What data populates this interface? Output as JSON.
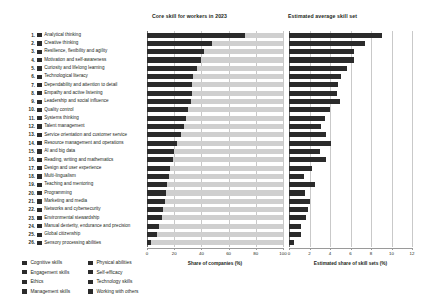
{
  "panels": {
    "left": {
      "title": "Core skill for workers in 2023",
      "axis_title": "Share of companies (%)",
      "ticks": [
        "0",
        "20",
        "40",
        "60",
        "80",
        "100"
      ]
    },
    "right": {
      "title": "Estimated average skill set",
      "axis_title": "Estimated share of skill sets (%)",
      "ticks": [
        "0",
        "2",
        "4",
        "6",
        "8",
        "10",
        "12"
      ]
    }
  },
  "legend": {
    "column1": [
      {
        "label": "Cognitive skills",
        "color": "#2b2b2b"
      },
      {
        "label": "Engagement skills",
        "color": "#2b2b2b"
      },
      {
        "label": "Ethics",
        "color": "#2b2b2b"
      },
      {
        "label": "Management skills",
        "color": "#2b2b2b"
      }
    ],
    "column2": [
      {
        "label": "Physical abilities",
        "color": "#2b2b2b"
      },
      {
        "label": "Self-efficacy",
        "color": "#2b2b2b"
      },
      {
        "label": "Technology skills",
        "color": "#2b2b2b"
      },
      {
        "label": "Working with others",
        "color": "#2b2b2b"
      }
    ]
  },
  "chart_data": {
    "type": "bar",
    "title": "Core skill for workers in 2023",
    "orientation": "horizontal",
    "grid": true,
    "legend_position": "bottom-left",
    "categories": [
      "Analytical thinking",
      "Creative thinking",
      "Resilience, flexibility and agility",
      "Motivation and self-awareness",
      "Curiosity and lifelong learning",
      "Technological literacy",
      "Dependability and attention to detail",
      "Empathy and active listening",
      "Leadership and social influence",
      "Quality control",
      "Systems thinking",
      "Talent management",
      "Service orientation and customer service",
      "Resource management and operations",
      "AI and big data",
      "Reading, writing and mathematics",
      "Design and user experience",
      "Multi-lingualism",
      "Teaching and mentoring",
      "Programming",
      "Marketing and media",
      "Networks and cybersecurity",
      "Environmental stewardship",
      "Manual dexterity, endurance and precision",
      "Global citizenship",
      "Sensory processing abilities"
    ],
    "category_colors": [
      "#2b2b2b",
      "#2b2b2b",
      "#2b2b2b",
      "#2b2b2b",
      "#2b2b2b",
      "#2b2b2b",
      "#2b2b2b",
      "#2b2b2b",
      "#2b2b2b",
      "#2b2b2b",
      "#2b2b2b",
      "#2b2b2b",
      "#2b2b2b",
      "#2b2b2b",
      "#2b2b2b",
      "#2b2b2b",
      "#2b2b2b",
      "#2b2b2b",
      "#2b2b2b",
      "#2b2b2b",
      "#2b2b2b",
      "#2b2b2b",
      "#2b2b2b",
      "#2b2b2b",
      "#2b2b2b",
      "#2b2b2b"
    ],
    "series": [
      {
        "name": "Share of companies (%)",
        "panel": "left",
        "xlabel": "Share of companies (%)",
        "xlim": [
          0,
          100
        ],
        "xticks": [
          0,
          20,
          40,
          60,
          80,
          100
        ],
        "values": [
          72,
          48,
          42,
          40,
          37,
          34,
          33,
          33,
          32,
          30,
          29,
          27,
          25,
          22,
          20,
          19,
          17,
          16,
          15,
          14,
          13,
          12,
          11,
          9,
          7,
          3
        ]
      },
      {
        "name": "Estimated share of skill sets (%)",
        "panel": "right",
        "xlabel": "Estimated share of skill sets (%)",
        "xlim": [
          0,
          12
        ],
        "xticks": [
          0,
          2,
          4,
          6,
          8,
          10,
          12
        ],
        "values": [
          9.1,
          7.4,
          6.3,
          6.3,
          5.7,
          5.1,
          4.8,
          4.7,
          5.0,
          4.0,
          3.5,
          3.1,
          3.6,
          4.1,
          3.0,
          3.6,
          2.2,
          1.5,
          2.5,
          1.6,
          2.0,
          1.9,
          1.7,
          1.2,
          1.2,
          0.5
        ]
      }
    ]
  }
}
